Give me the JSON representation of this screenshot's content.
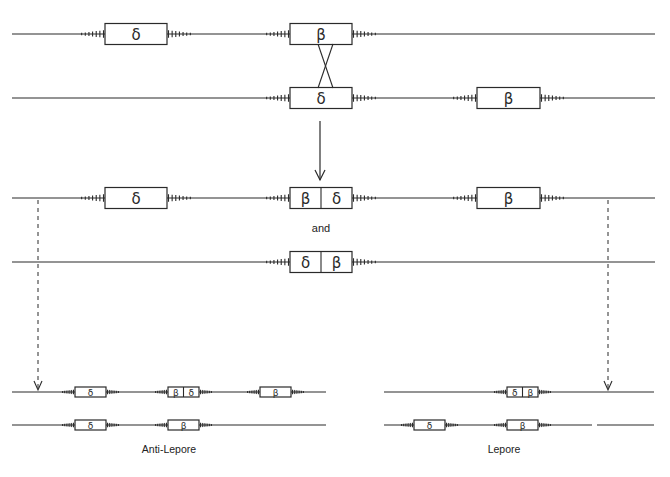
{
  "colors": {
    "line": "#2a2a2a",
    "background": "#ffffff"
  },
  "labels": {
    "and": "and",
    "anti_lepore": "Anti-Lepore",
    "lepore": "Lepore"
  },
  "genes": {
    "delta": "δ",
    "beta": "β"
  },
  "chromosomes": [
    {
      "id": "top-1",
      "y": 34,
      "x1": 12,
      "x2": 655,
      "h": 21,
      "tick": 1,
      "segments": [],
      "boxes": [
        {
          "x": 105,
          "w": 62,
          "cells": [
            "δ"
          ]
        },
        {
          "x": 290,
          "w": 62,
          "cells": [
            "β"
          ]
        }
      ]
    },
    {
      "id": "top-2",
      "y": 98,
      "x1": 12,
      "x2": 655,
      "h": 21,
      "tick": 1,
      "segments": [],
      "boxes": [
        {
          "x": 290,
          "w": 62,
          "cells": [
            "δ"
          ]
        },
        {
          "x": 477,
          "w": 63,
          "cells": [
            "β"
          ]
        }
      ]
    },
    {
      "id": "product-1",
      "y": 198,
      "x1": 12,
      "x2": 655,
      "h": 21,
      "tick": 1,
      "segments": [],
      "boxes": [
        {
          "x": 105,
          "w": 62,
          "cells": [
            "δ"
          ]
        },
        {
          "x": 290,
          "w": 62,
          "cells": [
            "β",
            "δ"
          ]
        },
        {
          "x": 477,
          "w": 63,
          "cells": [
            "β"
          ]
        }
      ]
    },
    {
      "id": "product-2",
      "y": 262,
      "x1": 12,
      "x2": 655,
      "h": 21,
      "tick": 1,
      "segments": [],
      "boxes": [
        {
          "x": 290,
          "w": 62,
          "cells": [
            "δ",
            "β"
          ]
        }
      ]
    },
    {
      "id": "anti-lepore-1",
      "y": 392,
      "x1": 12,
      "x2": 326,
      "h": 10,
      "tick": 0.5,
      "segments": [],
      "boxes": [
        {
          "x": 75,
          "w": 31,
          "cells": [
            "δ"
          ]
        },
        {
          "x": 168,
          "w": 31,
          "cells": [
            "β",
            "δ"
          ]
        },
        {
          "x": 260,
          "w": 31,
          "cells": [
            "β"
          ]
        }
      ]
    },
    {
      "id": "anti-lepore-2",
      "y": 425,
      "x1": 12,
      "x2": 326,
      "h": 10,
      "tick": 0.5,
      "segments": [],
      "boxes": [
        {
          "x": 75,
          "w": 31,
          "cells": [
            "δ"
          ]
        },
        {
          "x": 168,
          "w": 31,
          "cells": [
            "β"
          ]
        }
      ]
    },
    {
      "id": "lepore-1",
      "y": 392,
      "x1": 384,
      "x2": 654,
      "h": 10,
      "tick": 0.5,
      "segments": [],
      "boxes": [
        {
          "x": 507,
          "w": 31,
          "cells": [
            "δ",
            "β"
          ]
        }
      ]
    },
    {
      "id": "lepore-2",
      "y": 425,
      "x1": 384,
      "x2": 654,
      "h": 10,
      "tick": 0.5,
      "segments": [
        [
          384,
          592
        ],
        [
          597,
          654
        ]
      ],
      "boxes": [
        {
          "x": 414,
          "w": 31,
          "cells": [
            "δ"
          ]
        },
        {
          "x": 507,
          "w": 31,
          "cells": [
            "β"
          ]
        }
      ]
    }
  ],
  "crossover": {
    "x_left": 318,
    "x_right": 333,
    "y_top": 44,
    "y_bottom": 88
  },
  "main_arrow": {
    "x": 320,
    "y1": 121,
    "y2": 180
  },
  "dashed_arrows": [
    {
      "x": 38,
      "y1": 200,
      "y2": 390
    },
    {
      "x": 608,
      "y1": 200,
      "y2": 390
    }
  ],
  "label_positions": {
    "and": {
      "x": 321,
      "y": 222
    },
    "anti_lepore": {
      "x": 169,
      "y": 443
    },
    "lepore": {
      "x": 504,
      "y": 443
    }
  }
}
